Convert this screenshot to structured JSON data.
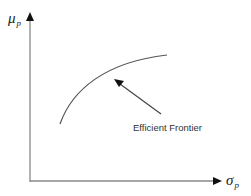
{
  "diagram": {
    "title": "Efficient Frontier",
    "y_axis": {
      "symbol": "μ",
      "subscript": "p"
    },
    "x_axis": {
      "symbol": "σ",
      "subscript": "p"
    },
    "annotation": {
      "text": "Efficient Frontier"
    },
    "colors": {
      "axis": "#888888",
      "curve": "#555555",
      "arrow": "#444444",
      "text": "#222222"
    }
  }
}
